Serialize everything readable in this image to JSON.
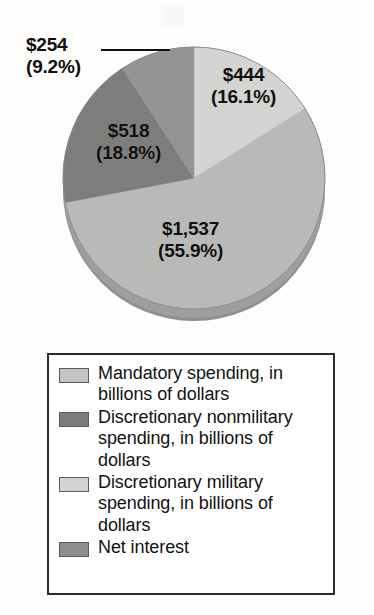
{
  "figure": {
    "leader_line_name": "net-interest-leader-line"
  },
  "chart_data": {
    "type": "pie",
    "title": "",
    "subtitle": "",
    "xlabel": "",
    "ylabel": "",
    "units": "billions of dollars",
    "legend_position": "bottom",
    "grid": false,
    "total": 2753,
    "categories": [
      "Discretionary military spending, in billions of dollars",
      "Mandatory spending, in billions of dollars",
      "Discretionary nonmilitary spending, in billions of dollars",
      "Net interest"
    ],
    "values": [
      444,
      1537,
      518,
      254
    ],
    "percentages": [
      16.1,
      55.9,
      18.8,
      9.2
    ],
    "colors": [
      "#d4d4d2",
      "#b9b9b7",
      "#7d7d7b",
      "#949492"
    ],
    "slices": [
      {
        "label_amount": "$444",
        "label_percent": "(16.1%)",
        "value": 444,
        "percent": 16.1,
        "color": "#d4d4d2",
        "category": "Discretionary military spending, in billions of dollars"
      },
      {
        "label_amount": "$1,537",
        "label_percent": "(55.9%)",
        "value": 1537,
        "percent": 55.9,
        "color": "#b9b9b7",
        "category": "Mandatory spending, in billions of dollars"
      },
      {
        "label_amount": "$518",
        "label_percent": "(18.8%)",
        "value": 518,
        "percent": 18.8,
        "color": "#7d7d7b",
        "category": "Discretionary nonmilitary spending, in billions of dollars"
      },
      {
        "label_amount": "$254",
        "label_percent": "(9.2%)",
        "value": 254,
        "percent": 9.2,
        "color": "#949492",
        "category": "Net interest"
      }
    ]
  },
  "legend": {
    "items": [
      {
        "label": "Mandatory spending, in billions of dollars",
        "color": "#c3c3c1"
      },
      {
        "label": "Discretionary nonmilitary spending, in billions of dollars",
        "color": "#7b7b79"
      },
      {
        "label": "Discretionary military spending, in billions of dollars",
        "color": "#d3d3d1"
      },
      {
        "label": "Net interest",
        "color": "#8e8e8c"
      }
    ]
  }
}
